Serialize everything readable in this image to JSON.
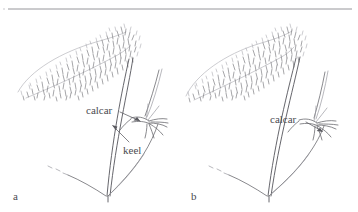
{
  "figure": {
    "kind": "botanical-line-drawing",
    "background_color": "#ffffff",
    "ink_color": "#6b6b70",
    "top_rule": {
      "name": "horizontal-rule",
      "x1": 8,
      "y1": 9,
      "x2": 352,
      "y2": 9,
      "color": "#8a8a90"
    },
    "panels": [
      {
        "id": "a",
        "label": "a",
        "label_x": 13,
        "label_y": 191,
        "annotations": [
          {
            "id": "calcar-a",
            "text": "calcar",
            "x": 86,
            "y": 105,
            "leader_from": [
              120,
              112
            ],
            "leader_to": [
              140,
              121
            ],
            "points_to": "spur"
          },
          {
            "id": "keel-a",
            "text": "keel",
            "x": 123,
            "y": 145,
            "leader_from": [
              128,
              143
            ],
            "leader_to": [
              112,
              126
            ],
            "points_to": "keel-ridge"
          }
        ]
      },
      {
        "id": "b",
        "label": "b",
        "label_x": 191,
        "label_y": 191,
        "annotations": [
          {
            "id": "calcar-b",
            "text": "calcar",
            "x": 270,
            "y": 114,
            "leader_from": [
              305,
              121
            ],
            "leader_to": [
              320,
              130
            ],
            "points_to": "spur"
          }
        ]
      }
    ]
  },
  "colors": {
    "ink": "#6b6b70",
    "ink_dark": "#55555b",
    "ink_faint": "#9a9aa0",
    "rule": "#8a8a90",
    "text": "#4a4a50",
    "background": "#ffffff"
  }
}
